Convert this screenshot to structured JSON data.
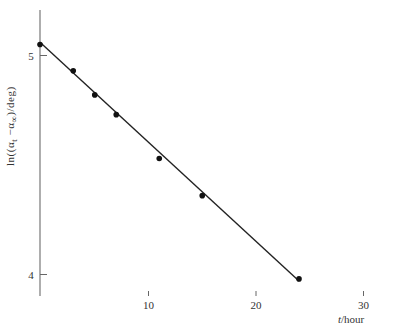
{
  "chart_data": {
    "type": "scatter",
    "title": "",
    "xlabel": "t/hour",
    "ylabel": "ln((α_t − α_∞)/deg)",
    "xlabel_parts": {
      "var": "t",
      "unit": "/hour"
    },
    "ylabel_parts": {
      "prefix": "ln((α",
      "sub1": "t",
      "mid": " −α",
      "sub2": "∞",
      "suffix": ")/deg)"
    },
    "x_ticks": [
      10,
      20,
      30
    ],
    "y_ticks": [
      4,
      5
    ],
    "xlim": [
      0,
      32.8
    ],
    "ylim": [
      3.9,
      5.21
    ],
    "grid": false,
    "legend": null,
    "series": [
      {
        "name": "measured",
        "marker": "filled-circle",
        "points": [
          {
            "x": 0,
            "y": 5.05
          },
          {
            "x": 3,
            "y": 4.93
          },
          {
            "x": 5,
            "y": 4.82
          },
          {
            "x": 7,
            "y": 4.73
          },
          {
            "x": 11,
            "y": 4.53
          },
          {
            "x": 15,
            "y": 4.36
          },
          {
            "x": 24,
            "y": 3.98
          }
        ]
      },
      {
        "name": "linear fit",
        "type": "line",
        "points": [
          {
            "x": 0,
            "y": 5.06
          },
          {
            "x": 24,
            "y": 3.97
          }
        ]
      }
    ]
  },
  "layout": {
    "x0_px": 41,
    "x_px_per_unit": 10.75,
    "y5_px": 55.5,
    "y_px_per_unit": 219,
    "axis_top_px": 10,
    "axis_bottom_px": 296,
    "axis_right_px": 393,
    "colors": {
      "axis": "#555555",
      "line": "#222222",
      "marker": "#111111"
    }
  }
}
